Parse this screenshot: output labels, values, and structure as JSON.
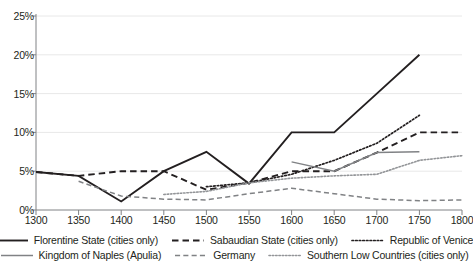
{
  "chart_data": {
    "type": "line",
    "title": "",
    "subtitle": "",
    "xlabel": "",
    "ylabel": "",
    "x": [
      1300,
      1350,
      1400,
      1450,
      1500,
      1550,
      1600,
      1650,
      1700,
      1750,
      1800
    ],
    "xlim": [
      1300,
      1800
    ],
    "ylim": [
      0,
      25
    ],
    "yticks": [
      0,
      5,
      10,
      15,
      20,
      25
    ],
    "ytick_labels": [
      "0%",
      "5%",
      "10%",
      "15%",
      "20%",
      "25%"
    ],
    "xtick_labels": [
      "1300",
      "1350",
      "1400",
      "1450",
      "1500",
      "1550",
      "1600",
      "1650",
      "1700",
      "1750",
      "1800"
    ],
    "grid": "horizontal",
    "legend_position": "bottom",
    "series": [
      {
        "name": "Florentine State (cities only)",
        "style": "solid",
        "color": "#231f20",
        "width": 1.9,
        "x": [
          1300,
          1350,
          1400,
          1450,
          1500,
          1550,
          1600,
          1650,
          1700,
          1750
        ],
        "values": [
          4.9,
          4.4,
          1.1,
          5.0,
          7.5,
          3.4,
          10.0,
          10.0,
          15.0,
          20.0
        ]
      },
      {
        "name": "Sabaudian State (cities only)",
        "style": "dashed",
        "color": "#231f20",
        "width": 1.9,
        "x": [
          1300,
          1350,
          1400,
          1450,
          1500,
          1550,
          1600,
          1650,
          1700,
          1750,
          1800
        ],
        "values": [
          4.9,
          4.4,
          5.0,
          5.0,
          2.6,
          3.5,
          5.0,
          5.0,
          7.4,
          10.0,
          10.0
        ]
      },
      {
        "name": "Republic of Venice",
        "style": "dotted",
        "color": "#231f20",
        "width": 1.7,
        "x": [
          1500,
          1550,
          1600,
          1650,
          1700,
          1750
        ],
        "values": [
          3.0,
          3.5,
          4.6,
          6.4,
          8.6,
          12.2
        ]
      },
      {
        "name": "Kingdom of Naples (Apulia)",
        "style": "solid",
        "color": "#808285",
        "width": 1.5,
        "x": [
          1600,
          1650,
          1700,
          1750
        ],
        "values": [
          6.2,
          5.0,
          7.4,
          7.5
        ]
      },
      {
        "name": "Germany",
        "style": "dashed",
        "color": "#808285",
        "width": 1.5,
        "x": [
          1350,
          1400,
          1450,
          1500,
          1550,
          1600,
          1650,
          1700,
          1750,
          1800
        ],
        "values": [
          3.7,
          1.8,
          1.4,
          1.3,
          2.1,
          2.8,
          2.1,
          1.4,
          1.2,
          1.3
        ]
      },
      {
        "name": "Southern Low Countries (cities only)",
        "style": "dotted",
        "color": "#939598",
        "width": 1.6,
        "x": [
          1450,
          1500,
          1550,
          1600,
          1650,
          1700,
          1750,
          1800
        ],
        "values": [
          2.0,
          2.4,
          3.5,
          4.1,
          4.4,
          4.6,
          6.4,
          7.0
        ]
      }
    ]
  },
  "legend": {
    "rows": [
      [
        {
          "label": "Florentine State (cities only)",
          "icon": "solid-line-swatch"
        },
        {
          "label": "Sabaudian State (cities only)",
          "icon": "dashed-line-swatch"
        },
        {
          "label": "Republic of Venice",
          "icon": "dotted-line-swatch"
        }
      ],
      [
        {
          "label": "Kingdom of Naples (Apulia)",
          "icon": "solid-line-swatch"
        },
        {
          "label": "Germany",
          "icon": "dashed-line-swatch"
        },
        {
          "label": "Southern Low Countries (cities only)",
          "icon": "dotted-line-swatch"
        }
      ]
    ]
  },
  "colors": {
    "axis": "#808285",
    "grid": "#e8e8e8",
    "text": "#231f20",
    "dark_series": "#231f20",
    "gray_series": "#808285",
    "light_gray_series": "#939598"
  }
}
